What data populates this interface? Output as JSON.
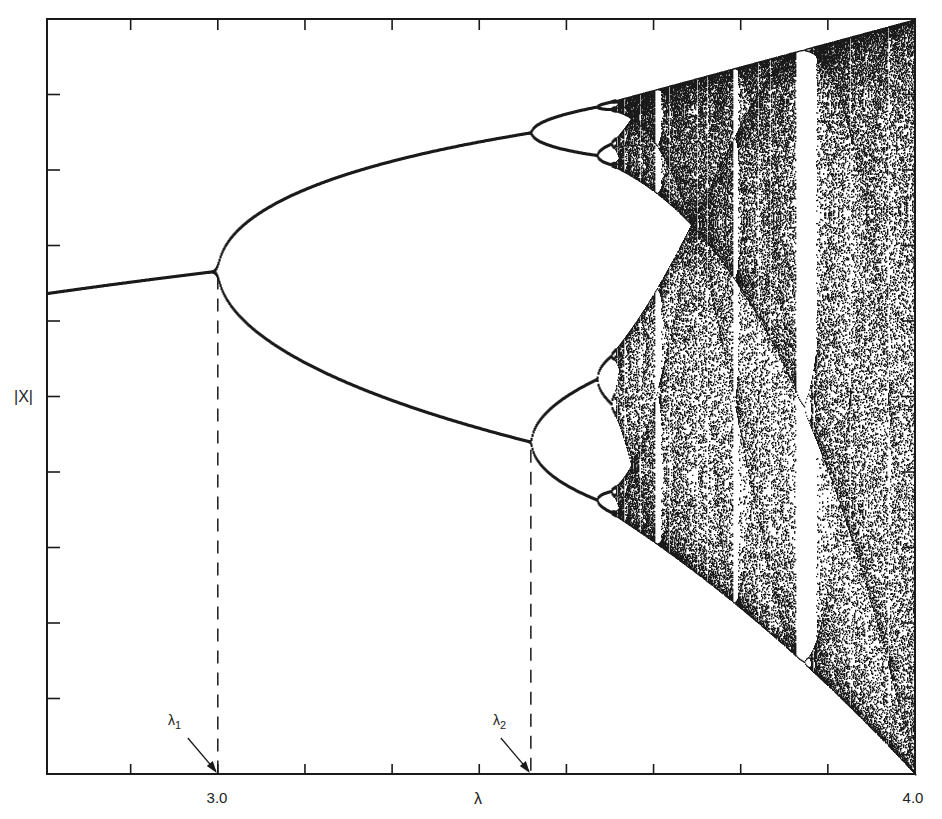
{
  "chart_data": {
    "type": "scatter",
    "title": "",
    "xlabel": "λ",
    "ylabel": "|X|",
    "xlim": [
      2.755,
      4.0
    ],
    "ylim": [
      0.0,
      1.0
    ],
    "x_tick_labels": [
      {
        "value": 3.0,
        "label": "3.0"
      },
      {
        "value": 4.0,
        "label": "4.0"
      }
    ],
    "x_tick_step": 0.125,
    "y_tick_count": 9,
    "y_tick_labels": [],
    "grid": false,
    "legend": null,
    "annotations": [
      {
        "label": "λ",
        "sub": "1",
        "value": 3.0,
        "style": "dashed vertical line with arrow"
      },
      {
        "label": "λ",
        "sub": "2",
        "value": 3.449,
        "style": "dashed vertical line with arrow"
      }
    ],
    "features": {
      "period_1_branch": {
        "x_range": [
          2.755,
          3.0
        ],
        "y_range": [
          0.637,
          0.667
        ]
      },
      "period_2_branch": {
        "x_range": [
          3.0,
          3.449
        ],
        "y_upper_end": 0.852,
        "y_lower_end": 0.44
      },
      "period_4_branch": {
        "x_range": [
          3.449,
          3.544
        ]
      },
      "chaos_onset": 3.57,
      "period_3_window": [
        3.828,
        3.857
      ],
      "attractor_max_at_4": 1.0,
      "attractor_min_at_4": 0.0
    }
  },
  "axes": {
    "x_label": "λ",
    "y_label": "|X|",
    "tick_label_3": "3.0",
    "tick_label_4": "4.0"
  },
  "annotations": {
    "lambda1_symbol": "λ",
    "lambda1_sub": "1",
    "lambda2_symbol": "λ",
    "lambda2_sub": "2"
  },
  "colors": {
    "ink": "#1a1a1a",
    "background": "#ffffff"
  }
}
